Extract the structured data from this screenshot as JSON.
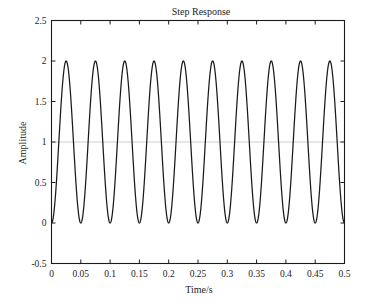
{
  "chart_data": {
    "type": "line",
    "title": "Step Response",
    "xlabel": "Time/s",
    "ylabel": "Amplitude",
    "xlim": [
      0,
      0.5
    ],
    "ylim": [
      -0.5,
      2.5
    ],
    "grid": false,
    "legend": null,
    "xticks": [
      "0",
      "0.05",
      "0.1",
      "0.15",
      "0.2",
      "0.25",
      "0.3",
      "0.35",
      "0.4",
      "0.45",
      "0.5"
    ],
    "xtick_values": [
      0,
      0.05,
      0.1,
      0.15,
      0.2,
      0.25,
      0.3,
      0.35,
      0.4,
      0.45,
      0.5
    ],
    "yticks": [
      "2.5",
      "2",
      "1.5",
      "1",
      "0.5",
      "0",
      "-0.5"
    ],
    "ytick_values": [
      2.5,
      2,
      1.5,
      1,
      0.5,
      0,
      -0.5
    ],
    "series": [
      {
        "name": "step response",
        "color": "#1a1a1a",
        "description": "undamped oscillation y = 1 - cos(2*pi*20*t)",
        "amplitude": 1,
        "offset": 1,
        "frequency_hz": 20,
        "period_s": 0.05,
        "cycles": 10,
        "ymin": 0,
        "ymax": 2,
        "x": [
          0,
          0.0125,
          0.025,
          0.0375,
          0.05,
          0.0625,
          0.075,
          0.0875,
          0.1,
          0.1125,
          0.125,
          0.1375,
          0.15,
          0.1625,
          0.175,
          0.1875,
          0.2,
          0.2125,
          0.225,
          0.2375,
          0.25,
          0.2625,
          0.275,
          0.2875,
          0.3,
          0.3125,
          0.325,
          0.3375,
          0.35,
          0.3625,
          0.375,
          0.3875,
          0.4,
          0.4125,
          0.425,
          0.4375,
          0.45,
          0.4625,
          0.475,
          0.4875,
          0.5
        ],
        "values": [
          0,
          1,
          2,
          1,
          0,
          1,
          2,
          1,
          0,
          1,
          2,
          1,
          0,
          1,
          2,
          1,
          0,
          1,
          2,
          1,
          0,
          1,
          2,
          1,
          0,
          1,
          2,
          1,
          0,
          1,
          2,
          1,
          0,
          1,
          2,
          1,
          0,
          1,
          2,
          1,
          0
        ]
      }
    ],
    "reference_line": {
      "name": "steady-state reference",
      "y": 1,
      "color": "#cfcfcf"
    }
  }
}
